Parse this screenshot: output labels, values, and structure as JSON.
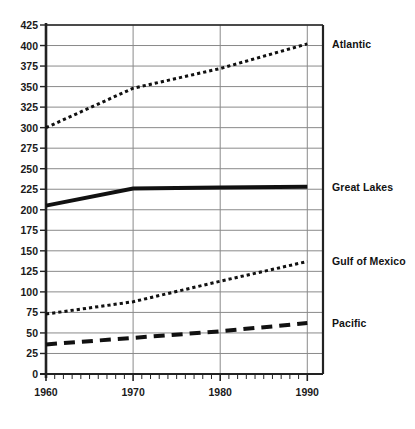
{
  "chart_data": {
    "type": "line",
    "title": "",
    "subtitle": "",
    "xlabel": "",
    "ylabel": "",
    "x": [
      1960,
      1970,
      1980,
      1990
    ],
    "xlim": [
      1960,
      1991
    ],
    "ylim": [
      0,
      425
    ],
    "grid": true,
    "legend_position": "right-inline",
    "x_tick_labels": [
      "1960",
      "1970",
      "1980",
      "1990"
    ],
    "x_minor_tick_interval": 1,
    "y_tick_labels": [
      "0",
      "25",
      "50",
      "75",
      "100",
      "125",
      "150",
      "175",
      "200",
      "225",
      "250",
      "275",
      "300",
      "325",
      "350",
      "375",
      "400",
      "425"
    ],
    "y_tick_values": [
      0,
      25,
      50,
      75,
      100,
      125,
      150,
      175,
      200,
      225,
      250,
      275,
      300,
      325,
      350,
      375,
      400,
      425
    ],
    "y_tick_interval": 25,
    "series": [
      {
        "name": "Atlantic",
        "line_style": "dotted",
        "line_width": 3,
        "color": "#111111",
        "values": [
          300,
          348,
          372,
          402
        ]
      },
      {
        "name": "Great Lakes",
        "line_style": "solid",
        "line_width": 4,
        "color": "#111111",
        "values": [
          205,
          226,
          227,
          228
        ]
      },
      {
        "name": "Gulf of Mexico",
        "line_style": "dotted",
        "line_width": 3,
        "color": "#111111",
        "values": [
          73,
          88,
          113,
          137
        ]
      },
      {
        "name": "Pacific",
        "line_style": "dashed",
        "line_width": 4,
        "color": "#111111",
        "values": [
          36,
          44,
          52,
          62
        ]
      }
    ]
  },
  "axes": {
    "axis_color": "#222222",
    "grid_color": "#8a8a8a"
  }
}
